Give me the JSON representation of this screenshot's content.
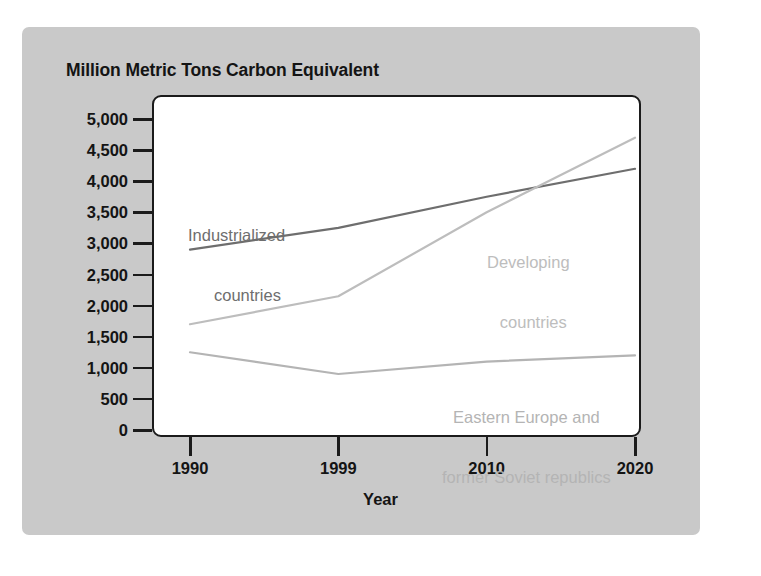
{
  "chart_data": {
    "type": "line",
    "title": "Million Metric Tons Carbon Equivalent",
    "xlabel": "Year",
    "ylabel": "Million Metric Tons Carbon Equivalent",
    "x": [
      1990,
      1999,
      2010,
      2020
    ],
    "x_tick_labels": [
      "1990",
      "1999",
      "2010",
      "2020"
    ],
    "y_ticks": [
      0,
      500,
      1000,
      1500,
      2000,
      2500,
      3000,
      3500,
      4000,
      4500,
      5000
    ],
    "y_tick_labels": [
      "0",
      "500",
      "1,000",
      "1,500",
      "2,000",
      "2,500",
      "3,000",
      "3,500",
      "4,000",
      "4,500",
      "5,000"
    ],
    "ylim": [
      0,
      5000
    ],
    "xlim": [
      1990,
      2020
    ],
    "grid": false,
    "legend": "inline-labels",
    "series": [
      {
        "name": "Industrialized countries",
        "color": "#6e6e6e",
        "values": [
          2900,
          3250,
          3750,
          4200
        ]
      },
      {
        "name": "Developing countries",
        "color": "#bdbdbd",
        "values": [
          1700,
          2150,
          3500,
          4700
        ]
      },
      {
        "name": "Eastern Europe and former Soviet republics",
        "color": "#b4b4b4",
        "values": [
          1250,
          900,
          1100,
          1200
        ]
      }
    ],
    "annotations": [
      {
        "text_line1": "Industrialized",
        "text_line2": "countries"
      },
      {
        "text_line1": "Developing",
        "text_line2": "countries"
      },
      {
        "text_line1": "Eastern Europe and",
        "text_line2": "former Soviet republics"
      }
    ]
  },
  "labels": {
    "title": "Million Metric Tons Carbon Equivalent",
    "x_axis_title": "Year",
    "series_industrialized_line1": "Industrialized",
    "series_industrialized_line2": "countries",
    "series_developing_line1": "Developing",
    "series_developing_line2": "countries",
    "series_eastern_line1": "Eastern Europe and",
    "series_eastern_line2": "former Soviet republics"
  },
  "colors": {
    "figure_background": "#c9c9c9",
    "plot_background": "#ffffff",
    "axis": "#1b1b1b",
    "industrialized": "#6e6e6e",
    "developing": "#bdbdbd",
    "eastern": "#b4b4b4"
  }
}
